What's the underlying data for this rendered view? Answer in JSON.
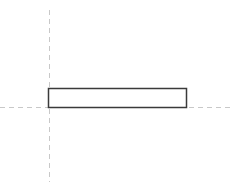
{
  "drawing": {
    "title": "Orthographic Part View",
    "view_name": "elevation-view",
    "canvas": {
      "width": 241,
      "height": 191,
      "background_color": "#ffffff"
    },
    "centerlines": {
      "style": "dashed",
      "color": "#c8c8c8",
      "stroke_width": 1,
      "dash_pattern": "5 4",
      "vertical": {
        "label": "vertical-centerline",
        "x": 49.5,
        "y_start": 10,
        "y_end": 182
      },
      "horizontal": {
        "label": "horizontal-centerline",
        "y": 107.5,
        "x_start": 0,
        "x_end": 233
      }
    },
    "part": {
      "label": "rectangular-plate",
      "shape": "rectangle",
      "x": 48.5,
      "y": 88.5,
      "width": 138,
      "height": 19,
      "fill_color": "#ffffff",
      "stroke_color": "#3a3a3a",
      "stroke_width": 1.5
    }
  }
}
